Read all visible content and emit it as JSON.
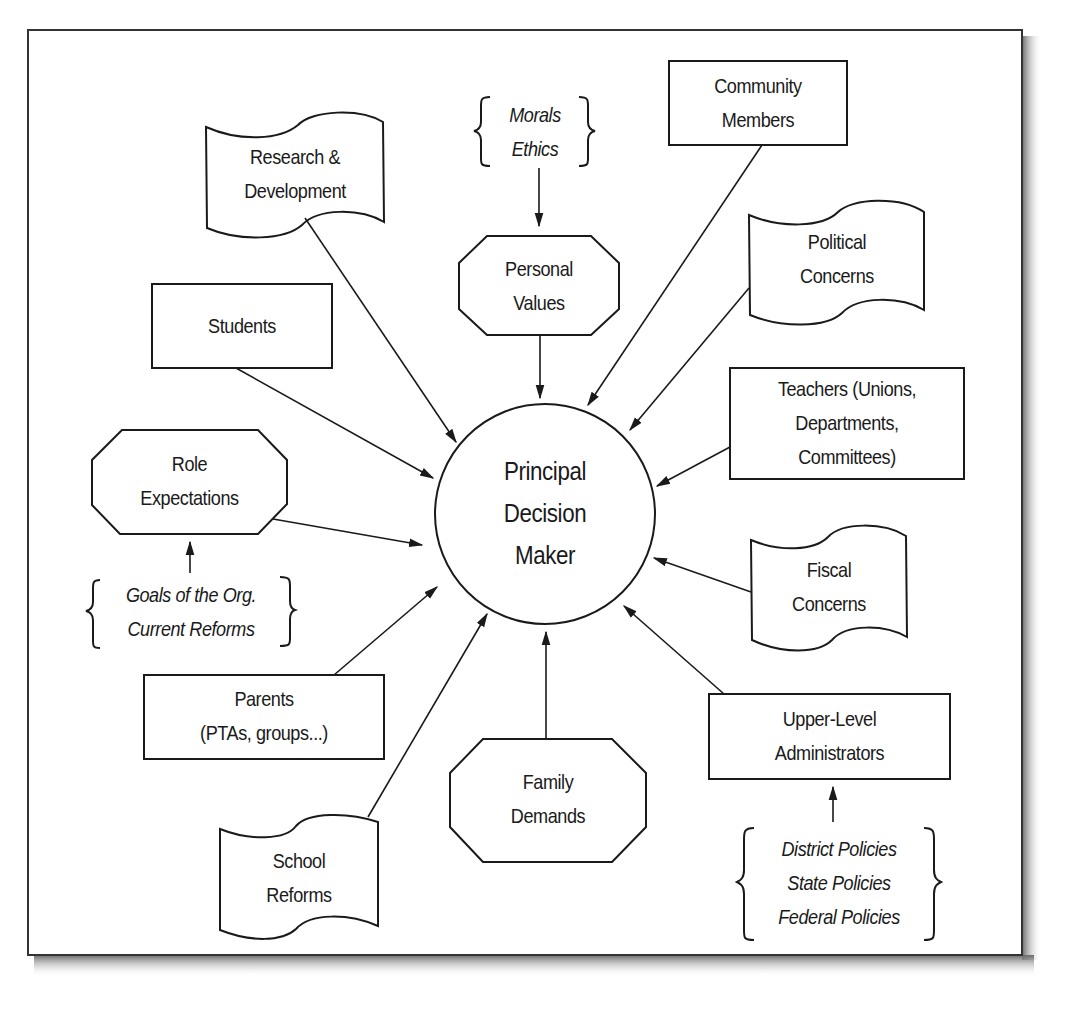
{
  "diagram": {
    "center": {
      "lines": [
        "Principal",
        "Decision",
        "Maker"
      ]
    },
    "nodes": {
      "research": {
        "lines": [
          "Research &",
          "Development"
        ],
        "shape": "flag"
      },
      "morals": {
        "lines": [
          "Morals",
          "Ethics"
        ],
        "shape": "brace"
      },
      "personal_values": {
        "lines": [
          "Personal",
          "Values"
        ],
        "shape": "octagon"
      },
      "community": {
        "lines": [
          "Community",
          "Members"
        ],
        "shape": "rectangle"
      },
      "political": {
        "lines": [
          "Political",
          "Concerns"
        ],
        "shape": "flag"
      },
      "students": {
        "lines": [
          "Students"
        ],
        "shape": "rectangle"
      },
      "teachers": {
        "lines": [
          "Teachers (Unions,",
          "Departments,",
          "Committees)"
        ],
        "shape": "rectangle"
      },
      "role": {
        "lines": [
          "Role",
          "Expectations"
        ],
        "shape": "octagon"
      },
      "goals": {
        "lines": [
          "Goals of the Org.",
          "Current Reforms"
        ],
        "shape": "brace"
      },
      "fiscal": {
        "lines": [
          "Fiscal",
          "Concerns"
        ],
        "shape": "flag"
      },
      "parents": {
        "lines": [
          "Parents",
          "(PTAs, groups...)"
        ],
        "shape": "rectangle"
      },
      "upper": {
        "lines": [
          "Upper-Level",
          "Administrators"
        ],
        "shape": "rectangle"
      },
      "family": {
        "lines": [
          "Family",
          "Demands"
        ],
        "shape": "octagon"
      },
      "school_reforms": {
        "lines": [
          "School",
          "Reforms"
        ],
        "shape": "flag"
      },
      "policies": {
        "lines": [
          "District Policies",
          "State Policies",
          "Federal Policies"
        ],
        "shape": "brace"
      }
    },
    "edges": [
      {
        "from": "morals",
        "to": "personal_values"
      },
      {
        "from": "personal_values",
        "to": "center"
      },
      {
        "from": "research",
        "to": "center"
      },
      {
        "from": "community",
        "to": "center"
      },
      {
        "from": "political",
        "to": "center"
      },
      {
        "from": "students",
        "to": "center"
      },
      {
        "from": "teachers",
        "to": "center"
      },
      {
        "from": "role",
        "to": "center"
      },
      {
        "from": "goals",
        "to": "role"
      },
      {
        "from": "fiscal",
        "to": "center"
      },
      {
        "from": "parents",
        "to": "center"
      },
      {
        "from": "upper",
        "to": "center"
      },
      {
        "from": "policies",
        "to": "upper"
      },
      {
        "from": "family",
        "to": "center"
      },
      {
        "from": "school_reforms",
        "to": "center"
      }
    ],
    "colors": {
      "stroke": "#1a1a1a",
      "background": "#ffffff",
      "shadow": "#8a8a8a"
    }
  }
}
